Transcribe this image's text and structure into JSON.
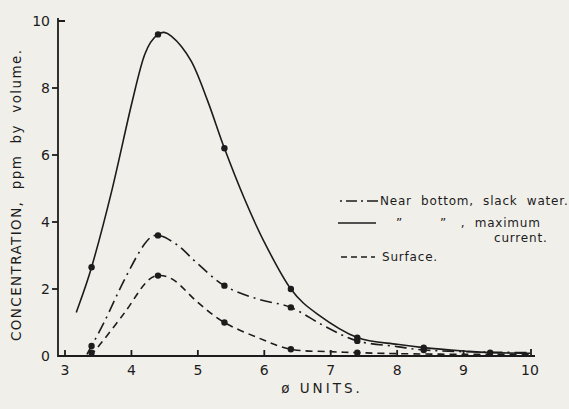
{
  "figure": {
    "background": "#f1efea",
    "ink": "#1c1c1c"
  },
  "chart_data": {
    "type": "line",
    "title": "",
    "xlabel": "ø UNITS.",
    "ylabel": "CONCENTRATION,  ppm  by  volume.",
    "xlim": [
      3,
      10
    ],
    "ylim": [
      0,
      10
    ],
    "x_ticks": [
      3,
      4,
      5,
      6,
      7,
      8,
      9,
      10
    ],
    "y_ticks": [
      0,
      2,
      4,
      6,
      8,
      10
    ],
    "grid": false,
    "legend_position": "right-middle",
    "series": [
      {
        "id": "near-bottom-slack-water",
        "name": "Near bottom, slack water",
        "style": "dashdot",
        "markers": [
          [
            3.4,
            0.3
          ],
          [
            4.4,
            3.6
          ],
          [
            5.4,
            2.1
          ],
          [
            6.4,
            1.45
          ],
          [
            7.4,
            0.45
          ],
          [
            8.4,
            0.18
          ]
        ],
        "curve": [
          [
            3.33,
            0.05
          ],
          [
            3.4,
            0.3
          ],
          [
            3.6,
            1.05
          ],
          [
            3.9,
            2.3
          ],
          [
            4.2,
            3.35
          ],
          [
            4.4,
            3.6
          ],
          [
            4.7,
            3.3
          ],
          [
            5.0,
            2.75
          ],
          [
            5.4,
            2.1
          ],
          [
            5.9,
            1.7
          ],
          [
            6.4,
            1.45
          ],
          [
            6.9,
            0.9
          ],
          [
            7.4,
            0.45
          ],
          [
            8.0,
            0.28
          ],
          [
            8.4,
            0.18
          ],
          [
            9.0,
            0.13
          ],
          [
            10.0,
            0.1
          ]
        ]
      },
      {
        "id": "near-bottom-maximum-current",
        "name": "Near bottom, maximum current",
        "style": "solid",
        "markers": [
          [
            3.4,
            2.65
          ],
          [
            4.4,
            9.6
          ],
          [
            5.4,
            6.2
          ],
          [
            6.4,
            2.0
          ],
          [
            7.4,
            0.55
          ],
          [
            8.4,
            0.25
          ],
          [
            9.4,
            0.1
          ]
        ],
        "curve": [
          [
            3.17,
            1.3
          ],
          [
            3.4,
            2.65
          ],
          [
            3.7,
            4.9
          ],
          [
            4.0,
            7.5
          ],
          [
            4.2,
            9.0
          ],
          [
            4.4,
            9.6
          ],
          [
            4.6,
            9.55
          ],
          [
            4.9,
            8.8
          ],
          [
            5.15,
            7.6
          ],
          [
            5.4,
            6.2
          ],
          [
            5.7,
            4.7
          ],
          [
            6.0,
            3.4
          ],
          [
            6.4,
            2.0
          ],
          [
            6.8,
            1.25
          ],
          [
            7.4,
            0.55
          ],
          [
            8.0,
            0.35
          ],
          [
            8.4,
            0.25
          ],
          [
            9.0,
            0.15
          ],
          [
            9.4,
            0.1
          ],
          [
            10.0,
            0.08
          ]
        ]
      },
      {
        "id": "surface",
        "name": "Surface",
        "style": "dashed",
        "markers": [
          [
            3.4,
            0.1
          ],
          [
            4.4,
            2.4
          ],
          [
            5.4,
            1.0
          ],
          [
            6.4,
            0.2
          ],
          [
            7.4,
            0.1
          ]
        ],
        "curve": [
          [
            3.38,
            0.0
          ],
          [
            3.55,
            0.4
          ],
          [
            3.9,
            1.3
          ],
          [
            4.2,
            2.15
          ],
          [
            4.4,
            2.4
          ],
          [
            4.65,
            2.25
          ],
          [
            5.0,
            1.6
          ],
          [
            5.4,
            1.0
          ],
          [
            5.9,
            0.55
          ],
          [
            6.4,
            0.2
          ],
          [
            7.0,
            0.13
          ],
          [
            7.4,
            0.1
          ],
          [
            8.0,
            0.07
          ],
          [
            9.0,
            0.05
          ],
          [
            10.0,
            0.05
          ]
        ]
      }
    ]
  },
  "legend": {
    "items": [
      {
        "style": "dashdot",
        "label": "Near  bottom,  slack  water."
      },
      {
        "style": "solid",
        "label_line1": "”        ”   ,  maximum",
        "label_line2": "current."
      },
      {
        "style": "dashed",
        "label": "Surface."
      }
    ]
  }
}
